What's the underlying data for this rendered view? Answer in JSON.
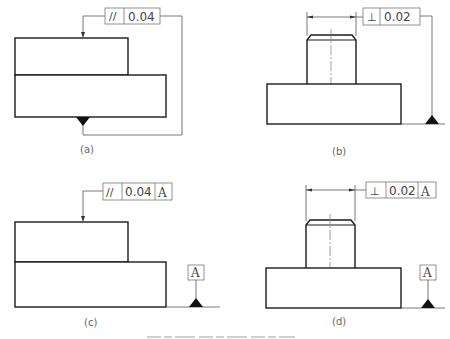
{
  "figure": {
    "caption_partial": "",
    "panels": [
      {
        "id": "a",
        "label": "(a)",
        "tolerance": {
          "symbol": "parallelism",
          "symbol_glyph": "//",
          "value": "0.04",
          "datum": null
        },
        "datum_indicator": "filled triangle on bottom surface"
      },
      {
        "id": "b",
        "label": "(b)",
        "tolerance": {
          "symbol": "perpendicularity",
          "symbol_glyph": "⊥",
          "value": "0.02",
          "datum": null
        },
        "datum_indicator": "filled triangle on base line"
      },
      {
        "id": "c",
        "label": "(c)",
        "tolerance": {
          "symbol": "parallelism",
          "symbol_glyph": "//",
          "value": "0.04",
          "datum": "A"
        },
        "datum_indicator": {
          "letter": "A"
        }
      },
      {
        "id": "d",
        "label": "(d)",
        "tolerance": {
          "symbol": "perpendicularity",
          "symbol_glyph": "⊥",
          "value": "0.02",
          "datum": "A"
        },
        "datum_indicator": {
          "letter": "A"
        }
      }
    ]
  }
}
